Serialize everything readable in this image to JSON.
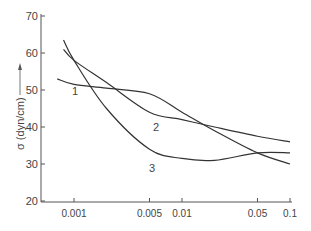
{
  "chart_data": {
    "type": "line",
    "title": "",
    "xlabel": "",
    "ylabel": "σ (dyn/cm)",
    "xscale": "log",
    "ylim": [
      20,
      70
    ],
    "xlim": [
      0.0006,
      0.1
    ],
    "x_ticks": [
      "0.001",
      "0.005",
      "0.01",
      "0.05",
      "0.1"
    ],
    "y_ticks": [
      "20",
      "30",
      "40",
      "50",
      "60",
      "70"
    ],
    "grid": false,
    "legend": "inline labels",
    "series": [
      {
        "name": "1",
        "x": [
          0.0007,
          0.001,
          0.002,
          0.005,
          0.01,
          0.02,
          0.05,
          0.1
        ],
        "values": [
          53,
          51.5,
          50.5,
          49,
          44,
          39,
          33,
          30
        ]
      },
      {
        "name": "2",
        "x": [
          0.0008,
          0.001,
          0.002,
          0.005,
          0.01,
          0.02,
          0.05,
          0.1
        ],
        "values": [
          61,
          58,
          52,
          44,
          42,
          40,
          37.5,
          36
        ]
      },
      {
        "name": "3",
        "x": [
          0.0008,
          0.001,
          0.002,
          0.005,
          0.01,
          0.02,
          0.05,
          0.1
        ],
        "values": [
          63.5,
          58,
          45,
          34,
          31.5,
          31,
          33,
          33
        ]
      }
    ]
  }
}
